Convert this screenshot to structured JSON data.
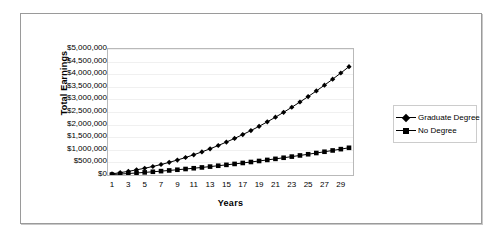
{
  "chart_data": {
    "type": "line",
    "title": "",
    "xlabel": "Years",
    "ylabel": "Total Earnings",
    "xlim": [
      1,
      30
    ],
    "ylim": [
      0,
      5000000
    ],
    "grid": true,
    "legend_position": "right",
    "x": [
      1,
      2,
      3,
      4,
      5,
      6,
      7,
      8,
      9,
      10,
      11,
      12,
      13,
      14,
      15,
      16,
      17,
      18,
      19,
      20,
      21,
      22,
      23,
      24,
      25,
      26,
      27,
      28,
      29,
      30
    ],
    "xtick_labels": [
      "1",
      "3",
      "5",
      "7",
      "9",
      "11",
      "13",
      "15",
      "17",
      "19",
      "21",
      "23",
      "25",
      "27",
      "29"
    ],
    "xtick_values": [
      1,
      3,
      5,
      7,
      9,
      11,
      13,
      15,
      17,
      19,
      21,
      23,
      25,
      27,
      29
    ],
    "ytick_labels": [
      "$5,000,000",
      "$4,500,000",
      "$4,000,000",
      "$3,500,000",
      "$3,000,000",
      "$2,500,000",
      "$2,000,000",
      "$1,500,000",
      "$1,000,000",
      "$500,000",
      "$0"
    ],
    "ytick_values": [
      5000000,
      4500000,
      4000000,
      3500000,
      3000000,
      2500000,
      2000000,
      1500000,
      1000000,
      500000,
      0
    ],
    "series": [
      {
        "name": "Graduate Degree",
        "marker": "diamond",
        "color": "#000000",
        "values": [
          60000,
          125000,
          195000,
          275000,
          360000,
          455000,
          560000,
          675000,
          800000,
          935000,
          1080000,
          1235000,
          1400000,
          1575000,
          1760000,
          1955000,
          2160000,
          2375000,
          2600000,
          2840000,
          3090000,
          3350000,
          3620000,
          3900000,
          4190000,
          4490000,
          4800000,
          5120000,
          5450000,
          5790000
        ],
        "final_value": 4300000
      },
      {
        "name": "No Degree",
        "marker": "square",
        "color": "#000000",
        "values": [
          30000,
          62000,
          96000,
          132000,
          170000,
          210000,
          252000,
          296000,
          342000,
          390000,
          440000,
          492000,
          546000,
          602000,
          660000,
          720000,
          782000,
          846000,
          912000,
          980000,
          1050000,
          1122000,
          1196000,
          1272000,
          1350000,
          1430000,
          1512000,
          1596000,
          1682000,
          1770000
        ],
        "final_value": 1080000
      }
    ]
  },
  "legend": {
    "items": [
      {
        "label": "Graduate Degree",
        "marker": "diamond"
      },
      {
        "label": "No Degree",
        "marker": "square"
      }
    ]
  },
  "colors": {
    "series": "#000000",
    "plot_border": "#b9b9b9",
    "figure_border": "#9a9a9a",
    "gridline": "#f0f0f0",
    "background": "#ffffff"
  }
}
